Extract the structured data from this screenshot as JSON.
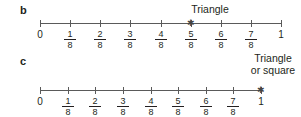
{
  "parts": [
    {
      "label": "b",
      "annotation": "Triangle",
      "marked_tick": "5/8",
      "ticks": [
        {
          "type": "whole",
          "text": "0"
        },
        {
          "type": "frac",
          "num": "1",
          "den": "8"
        },
        {
          "type": "frac",
          "num": "2",
          "den": "8"
        },
        {
          "type": "frac",
          "num": "3",
          "den": "8"
        },
        {
          "type": "frac",
          "num": "4",
          "den": "8"
        },
        {
          "type": "frac",
          "num": "5",
          "den": "8"
        },
        {
          "type": "frac",
          "num": "6",
          "den": "8"
        },
        {
          "type": "frac",
          "num": "7",
          "den": "8"
        },
        {
          "type": "whole",
          "text": "1"
        }
      ]
    },
    {
      "label": "c",
      "annotation_line1": "Triangle",
      "annotation_line2": "or square",
      "marked_tick": "1",
      "ticks": [
        {
          "type": "whole",
          "text": "0"
        },
        {
          "type": "frac",
          "num": "1",
          "den": "8"
        },
        {
          "type": "frac",
          "num": "2",
          "den": "8"
        },
        {
          "type": "frac",
          "num": "3",
          "den": "8"
        },
        {
          "type": "frac",
          "num": "4",
          "den": "8"
        },
        {
          "type": "frac",
          "num": "5",
          "den": "8"
        },
        {
          "type": "frac",
          "num": "6",
          "den": "8"
        },
        {
          "type": "frac",
          "num": "7",
          "den": "8"
        },
        {
          "type": "whole",
          "text": "1"
        }
      ]
    }
  ],
  "marker_symbol": "✱"
}
